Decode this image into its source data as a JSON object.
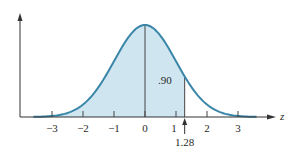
{
  "chart_data": {
    "type": "area",
    "title": "",
    "xlabel": "z",
    "ylabel": "",
    "distribution": "standard normal",
    "xlim": [
      -3,
      3
    ],
    "x_ticks": [
      -3,
      -2,
      -1,
      0,
      1,
      2,
      3
    ],
    "x_tick_labels": [
      "−3",
      "−2",
      "−1",
      "0",
      "1",
      "2",
      "3"
    ],
    "shaded_region": {
      "from": -3,
      "to": 1.28,
      "area": 0.9
    },
    "area_label": ".90",
    "marker": {
      "x": 1.28,
      "label": "1.28"
    },
    "center_line_x": 0,
    "grid": false,
    "colors": {
      "curve": "#3a86a8",
      "fill": "#cfe6f1",
      "axis": "#333333"
    }
  }
}
